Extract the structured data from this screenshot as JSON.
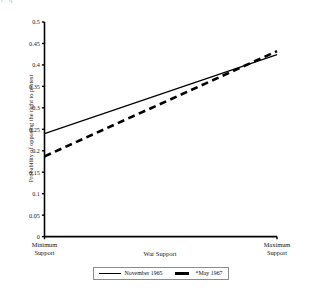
{
  "artifact": {
    "text": "r  q"
  },
  "chart_data": {
    "type": "line",
    "title": "",
    "xlabel": "War Support",
    "ylabel": "Probability of opposing the right to protest",
    "ylim": [
      0,
      0.5
    ],
    "ytick_labels": [
      "0.5",
      "0.45",
      "0.4",
      "0.35",
      "0.3",
      "0.25",
      "0.2",
      "0.15",
      "0.1",
      "0.05",
      "0"
    ],
    "ytick_values": [
      0.5,
      0.45,
      0.4,
      0.35,
      0.3,
      0.25,
      0.2,
      0.15,
      0.1,
      0.05,
      0
    ],
    "x_categories": [
      "Minimum Support",
      "Maximum Support"
    ],
    "xtick_labels": [
      {
        "line1": "Minimum",
        "line2": "Support"
      },
      {
        "line1": "Maximum",
        "line2": "Support"
      }
    ],
    "grid": false,
    "legend_position": "bottom",
    "series": [
      {
        "name": "November 1965",
        "style": "solid",
        "color": "#000000",
        "x": [
          0,
          1
        ],
        "values": [
          0.24,
          0.424
        ]
      },
      {
        "name": "*May 1967",
        "style": "dashed",
        "color": "#000000",
        "x": [
          0,
          1
        ],
        "values": [
          0.187,
          0.432
        ]
      }
    ]
  }
}
